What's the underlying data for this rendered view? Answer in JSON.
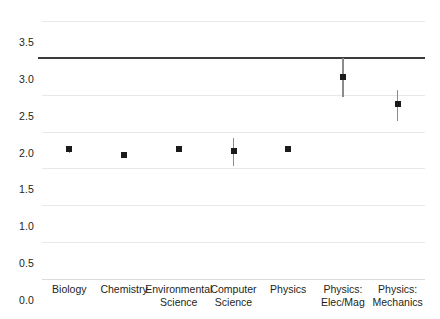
{
  "chart_data": {
    "type": "scatter",
    "title": "",
    "subtitle": "",
    "xlabel": "",
    "ylabel": "",
    "ylim": [
      0.0,
      3.5
    ],
    "yticks": [
      "0.0",
      "0.5",
      "1.0",
      "1.5",
      "2.0",
      "2.5",
      "3.0",
      "3.5"
    ],
    "ytick_values": [
      0.0,
      0.5,
      1.0,
      1.5,
      2.0,
      2.5,
      3.0,
      3.5
    ],
    "grid": true,
    "legend": "none",
    "reference_line": {
      "value": 3.0,
      "label": "",
      "color": "#3b3b3b"
    },
    "marker_color": "#1a1a1a",
    "errorbar_color": "#8b8b8b",
    "gridline_color": "#e8e8e8",
    "categories": [
      "Biology",
      "Chemistry",
      "Environmental\nScience",
      "Computer\nScience",
      "Physics",
      "Physics:\nElec/Mag",
      "Physics:\nMechanics"
    ],
    "values": [
      1.76,
      1.68,
      1.76,
      1.73,
      1.76,
      2.74,
      2.37
    ],
    "error_low": [
      1.71,
      1.65,
      1.72,
      1.53,
      1.72,
      2.47,
      2.15
    ],
    "error_high": [
      1.81,
      1.72,
      1.8,
      1.91,
      1.8,
      3.0,
      2.56
    ],
    "series": [
      {
        "name": "Mean rating",
        "values": [
          1.76,
          1.68,
          1.76,
          1.73,
          1.76,
          2.74,
          2.37
        ]
      }
    ]
  }
}
